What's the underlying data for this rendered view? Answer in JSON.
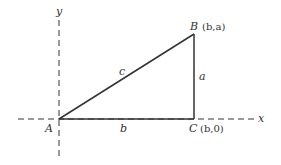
{
  "diagram": {
    "type": "right-triangle-on-axes",
    "axes": {
      "x_label": "x",
      "y_label": "y",
      "style": "dashed"
    },
    "vertices": {
      "A": {
        "label": "A",
        "coords": ""
      },
      "B": {
        "label": "B",
        "coords": "(b,a)"
      },
      "C": {
        "label": "C",
        "coords": "(b,0)"
      }
    },
    "sides": {
      "hypotenuse": "c",
      "vertical": "a",
      "horizontal": "b"
    },
    "colors": {
      "line": "#333333",
      "background": "#ffffff"
    }
  }
}
